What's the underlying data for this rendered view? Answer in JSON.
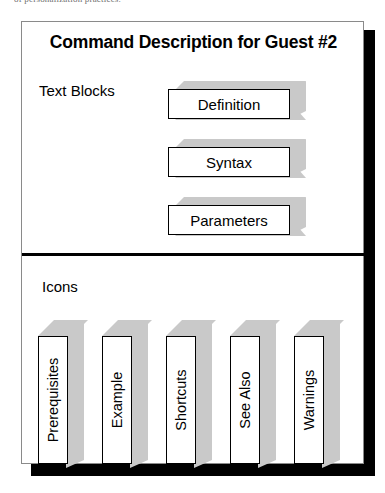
{
  "scan_artifact": {
    "top_cut_text": "of personalization practices."
  },
  "diagram": {
    "title": "Command Description for Guest #2",
    "sections": [
      {
        "label": "Text Blocks",
        "orientation": "horizontal",
        "blocks": [
          {
            "label": "Definition"
          },
          {
            "label": "Syntax"
          },
          {
            "label": "Parameters"
          }
        ]
      },
      {
        "label": "Icons",
        "orientation": "vertical",
        "blocks": [
          {
            "label": "Prerequisites"
          },
          {
            "label": "Example"
          },
          {
            "label": "Shortcuts"
          },
          {
            "label": "See Also"
          },
          {
            "label": "Warnings"
          }
        ]
      }
    ],
    "colors": {
      "page_background": "#ffffff",
      "block_face": "#ffffff",
      "block_shade": "#c9c9c9",
      "outline": "#000000",
      "frame_border": "#8a8a8a",
      "drop_shadow": "#000000",
      "text": "#000000"
    }
  }
}
